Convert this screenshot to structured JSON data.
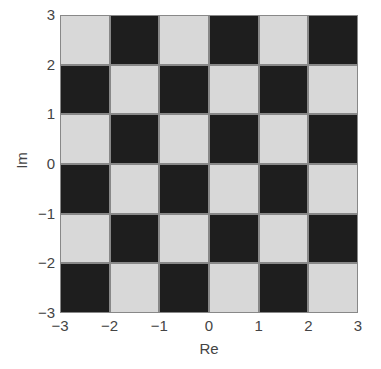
{
  "chart_data": {
    "type": "heatmap",
    "title": "",
    "xlabel": "Re",
    "ylabel": "Im",
    "xlim": [
      -3,
      3
    ],
    "ylim": [
      -3,
      3
    ],
    "x_ticks": [
      "−3",
      "−2",
      "−1",
      "0",
      "1",
      "2",
      "3"
    ],
    "y_ticks": [
      "3",
      "2",
      "1",
      "0",
      "−1",
      "−2",
      "−3"
    ],
    "grid": false,
    "colors": {
      "light": "#d8d8d8",
      "dark": "#1e1e1e",
      "cell_border": "#888888"
    },
    "rows_top_to_bottom": [
      [
        "L",
        "D",
        "L",
        "D",
        "L",
        "D"
      ],
      [
        "D",
        "L",
        "D",
        "L",
        "D",
        "L"
      ],
      [
        "L",
        "D",
        "L",
        "D",
        "L",
        "D"
      ],
      [
        "D",
        "L",
        "D",
        "L",
        "D",
        "L"
      ],
      [
        "L",
        "D",
        "L",
        "D",
        "L",
        "D"
      ],
      [
        "D",
        "L",
        "D",
        "L",
        "D",
        "L"
      ]
    ]
  }
}
